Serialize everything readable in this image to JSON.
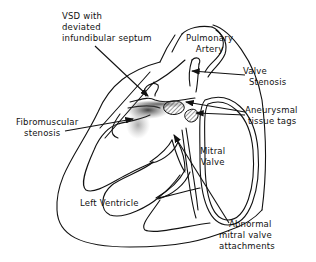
{
  "diagram": {
    "labels": {
      "vsd": [
        "VSD with",
        "deviated",
        "infundibular  septum"
      ],
      "pulmonary_artery": [
        "Pulmonary",
        "Artery"
      ],
      "valve_stenosis": [
        "Valve",
        "Stenosis"
      ],
      "aneurysmal_tissue_tags": [
        "Aneurysmal",
        "tissue  tags"
      ],
      "fibromuscular_stenosis": [
        "Fibromuscular",
        "stenosis"
      ],
      "mitral_valve": [
        "Mitral",
        "Valve"
      ],
      "left_ventricle": [
        "Left  Ventricle"
      ],
      "abnormal_mitral_attachments": [
        "Abnormal",
        "mitral  valve",
        "attachments"
      ]
    },
    "colors": {
      "line": "#111111",
      "background": "#ffffff",
      "shade": "#555555"
    }
  }
}
